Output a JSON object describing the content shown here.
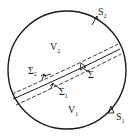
{
  "diagram": {
    "type": "domain-partition",
    "colors": {
      "stroke": "#1a1a1a",
      "background": "#ffffff"
    },
    "labels": {
      "v2": {
        "main": "V",
        "sub": "2"
      },
      "v1": {
        "main": "V",
        "sub": "1"
      },
      "s2": {
        "main": "S",
        "sub": "2"
      },
      "s1": {
        "main": "S",
        "sub": "1"
      },
      "sigma": {
        "main": "Σ",
        "sub": ""
      },
      "sigma1": {
        "main": "Σ",
        "sub": "1"
      },
      "sigma2": {
        "main": "Σ",
        "sub": "2"
      }
    },
    "elements": [
      "outer circle boundary",
      "central solid interface curve Σ",
      "upper dashed curve Σ2",
      "lower dashed curve Σ1",
      "normal arrows on S1, S2, Σ, Σ1, Σ2"
    ]
  }
}
